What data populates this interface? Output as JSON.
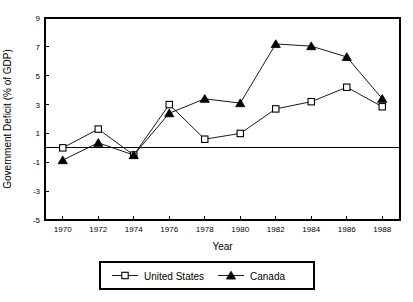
{
  "chart_data": {
    "type": "line",
    "title": "",
    "xlabel": "Year",
    "ylabel": "Government Deficit (% of GDP)",
    "x": [
      1970,
      1972,
      1974,
      1976,
      1978,
      1980,
      1982,
      1984,
      1986,
      1988
    ],
    "xticklabels": [
      "1970",
      "1972",
      "1974",
      "1976",
      "1978",
      "1980",
      "1982",
      "1984",
      "1986",
      "1988"
    ],
    "yticks": [
      -5,
      -3,
      -1,
      1,
      3,
      5,
      7,
      9
    ],
    "yticklabels": [
      "-5",
      "-3",
      "-1",
      "1",
      "3",
      "5",
      "7",
      "9"
    ],
    "ylim": [
      -5,
      9
    ],
    "xlim": [
      1969,
      1989
    ],
    "grid": false,
    "zero_line": true,
    "legend_position": "below",
    "series": [
      {
        "name": "United States",
        "marker": "open-square",
        "values": [
          0.0,
          1.3,
          -0.5,
          3.0,
          0.6,
          1.0,
          2.7,
          3.2,
          4.2,
          2.85
        ]
      },
      {
        "name": "Canada",
        "marker": "filled-triangle",
        "values": [
          -0.85,
          0.35,
          -0.5,
          2.4,
          3.4,
          3.1,
          7.2,
          7.05,
          6.3,
          3.4
        ]
      }
    ]
  },
  "legend": {
    "entries": [
      {
        "label": "United States",
        "marker": "open-square"
      },
      {
        "label": "Canada",
        "marker": "filled-triangle"
      }
    ]
  },
  "colors": {
    "background": "#ffffff",
    "foreground": "#000000"
  }
}
